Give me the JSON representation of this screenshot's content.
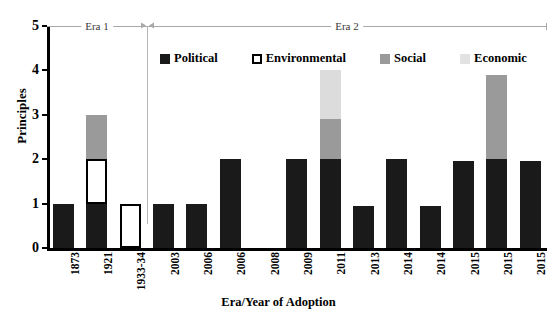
{
  "chart_data": {
    "type": "bar",
    "title": "",
    "subtitle": "",
    "xlabel": "Era/Year of Adoption",
    "ylabel": "Principles",
    "ylim": [
      0,
      5
    ],
    "yticks": [
      0,
      1,
      2,
      3,
      4,
      5
    ],
    "grid": false,
    "stacked": true,
    "legend_position": "top-inside",
    "categories": [
      "1873",
      "1921",
      "1933-34",
      "2003",
      "2006",
      "2006",
      "2008",
      "2009",
      "2011",
      "2013",
      "2014",
      "2014",
      "2015",
      "2015",
      "2015"
    ],
    "series": [
      {
        "name": "Political",
        "color": "#1a1a1a",
        "values": [
          1,
          1,
          0,
          1,
          1,
          2,
          0,
          2,
          2,
          0.95,
          2,
          0.95,
          1.95,
          2,
          1.95
        ]
      },
      {
        "name": "Environmental",
        "color": "#ffffff",
        "values": [
          0,
          1,
          1,
          0,
          0,
          0,
          0,
          0,
          0,
          0,
          0,
          0,
          0,
          0,
          0
        ]
      },
      {
        "name": "Social",
        "color": "#9a9a9a",
        "values": [
          0,
          1,
          0,
          0,
          0,
          0,
          0,
          0,
          0.9,
          0,
          0,
          0,
          0,
          1.9,
          0
        ]
      },
      {
        "name": "Economic",
        "color": "#dcdcdc",
        "values": [
          0,
          0,
          0,
          0,
          0,
          0,
          0,
          0,
          1.1,
          0,
          0,
          0,
          0,
          0,
          0
        ]
      }
    ],
    "annotations": [
      {
        "label": "Era 1",
        "from_category": "1873",
        "to_category": "1933-34"
      },
      {
        "label": "Era 2",
        "from_category": "2003",
        "to_category": "2015"
      }
    ]
  },
  "legend": {
    "items": [
      {
        "label": "Political",
        "swatch": "political"
      },
      {
        "label": "Environmental",
        "swatch": "environmental"
      },
      {
        "label": "Social",
        "swatch": "social"
      },
      {
        "label": "Economic",
        "swatch": "economic"
      }
    ]
  },
  "axes": {
    "y_title": "Principles",
    "x_title": "Era/Year of Adoption",
    "y_tick_labels": [
      "0",
      "1",
      "2",
      "3",
      "4",
      "5"
    ]
  },
  "eras": {
    "era1_label": "Era 1",
    "era2_label": "Era 2"
  }
}
